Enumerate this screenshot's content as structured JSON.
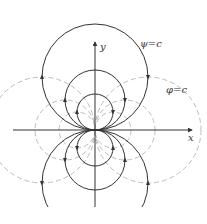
{
  "figure": {
    "labels": {
      "x_axis": "x",
      "y_axis": "y",
      "streamline": "ψ=c",
      "potential": "φ=c"
    },
    "colors": {
      "streamline": "#333333",
      "potential": "#bdbdbd",
      "axis": "#333333"
    },
    "origin": [
      95,
      130
    ],
    "streamlines_upper": [
      {
        "cx": 95,
        "cy": 77,
        "r": 53
      },
      {
        "cx": 95,
        "cy": 100,
        "r": 30
      },
      {
        "cx": 95,
        "cy": 112,
        "r": 18
      }
    ],
    "streamlines_lower": [
      {
        "cx": 95,
        "cy": 183,
        "r": 53
      },
      {
        "cx": 95,
        "cy": 160,
        "r": 30
      },
      {
        "cx": 95,
        "cy": 148,
        "r": 18
      }
    ],
    "potential_right": [
      {
        "cx": 148,
        "cy": 130,
        "r": 53
      },
      {
        "cx": 125,
        "cy": 130,
        "r": 30
      },
      {
        "cx": 113,
        "cy": 130,
        "r": 18
      }
    ],
    "potential_left": [
      {
        "cx": 42,
        "cy": 130,
        "r": 53
      },
      {
        "cx": 65,
        "cy": 130,
        "r": 30
      },
      {
        "cx": 77,
        "cy": 130,
        "r": 18
      }
    ]
  }
}
